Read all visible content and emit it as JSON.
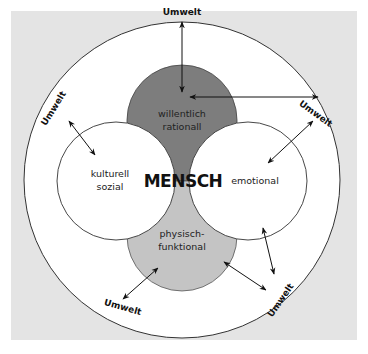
{
  "diagram": {
    "center_label": "MENSCH",
    "regions": {
      "top": {
        "line1": "willentlich",
        "line2": "rationall",
        "color": "#7d7d7d"
      },
      "bottom": {
        "line1": "physisch-",
        "line2": "funktional",
        "color": "#c4c4c4"
      },
      "left": {
        "line1": "kulturell",
        "line2": "sozial",
        "color": "#ffffff"
      },
      "right": {
        "line1": "emotional",
        "color": "#ffffff"
      }
    },
    "outer_ring": {
      "color": "#ffffff"
    },
    "background": {
      "color": "#e4e4e4"
    },
    "environment_labels": {
      "top": "Umwelt",
      "upper_right": "Umwelt",
      "upper_left": "Umwelt",
      "lower_left": "Umwelt",
      "lower_right": "Umwelt"
    },
    "arrows": [
      {
        "id": "top-vertical",
        "from": [
          182,
          22
        ],
        "to": [
          182,
          92
        ]
      },
      {
        "id": "top-horizontal",
        "from": [
          190,
          97
        ],
        "to": [
          318,
          97
        ]
      },
      {
        "id": "upper-right",
        "from": [
          313,
          121
        ],
        "to": [
          268,
          163
        ]
      },
      {
        "id": "right-vertical",
        "from": [
          263,
          228
        ],
        "to": [
          274,
          274
        ]
      },
      {
        "id": "right-diagonal",
        "from": [
          224,
          262
        ],
        "to": [
          266,
          290
        ]
      },
      {
        "id": "lower-left",
        "from": [
          158,
          268
        ],
        "to": [
          123,
          299
        ]
      },
      {
        "id": "upper-left",
        "from": [
          69,
          121
        ],
        "to": [
          95,
          155
        ]
      }
    ]
  }
}
